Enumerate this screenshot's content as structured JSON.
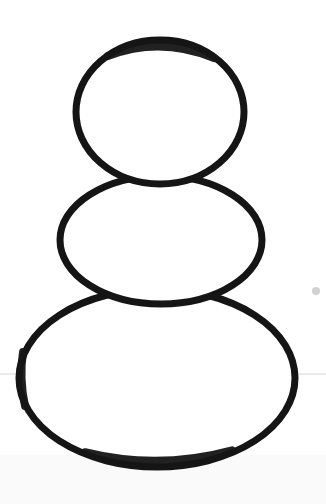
{
  "image": {
    "title": "Snowman outline drawing",
    "subject": "snowman",
    "style": "hand-drawn black marker outline on white paper",
    "background_color": "#ffffff",
    "width": 326,
    "height": 504,
    "alt_text": "Three stacked ellipses forming a snowman body outline drawn in thick black ink on white paper",
    "stroke": {
      "color": "#151515",
      "width_px": 7,
      "linecap": "round",
      "linejoin": "round"
    }
  },
  "shapes": {
    "head": {
      "name": "head-ball",
      "label": "Head (top ball)",
      "cx": 160,
      "cy": 112,
      "rx": 84,
      "ry": 72,
      "stroke_width": 7,
      "color": "#151515",
      "fill": "#ffffff"
    },
    "torso": {
      "name": "torso-ball",
      "label": "Torso (middle ball)",
      "cx": 161,
      "cy": 240,
      "rx": 101,
      "ry": 64,
      "stroke_width": 7,
      "color": "#151515",
      "fill": "#ffffff"
    },
    "base": {
      "name": "base-ball",
      "label": "Base (bottom ball)",
      "cx": 157,
      "cy": 378,
      "rx": 138,
      "ry": 89,
      "stroke_width": 7,
      "color": "#151515",
      "fill": "#ffffff"
    }
  },
  "artifacts": {
    "ground_line": {
      "name": "faint-horizontal-line",
      "label": "Faint horizontal pencil line across page",
      "y": 374,
      "x1": 0,
      "x2": 326,
      "color": "#d8d8d8",
      "width_px": 1.2
    },
    "speck": {
      "name": "paper-speck",
      "label": "Small gray speck on paper",
      "cx": 316,
      "cy": 291,
      "r": 4,
      "color": "#b9b9b9"
    },
    "shadow": {
      "name": "bottom-paper-shading",
      "label": "Very light paper shading near bottom edge",
      "color": "#fafafa"
    }
  }
}
